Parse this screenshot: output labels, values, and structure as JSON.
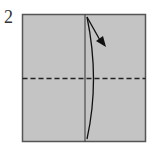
{
  "diagram": {
    "step_number": "2",
    "paper_color": "#c4c4c4",
    "border_color": "#555555",
    "line_color": "#111111",
    "elements": [
      {
        "type": "square",
        "label": "paper"
      },
      {
        "type": "crease",
        "label": "vertical center crease"
      },
      {
        "type": "valley-fold-line",
        "label": "horizontal dashed fold line"
      },
      {
        "type": "arrow",
        "label": "fold direction arrow (curved, pointing to upper right)"
      }
    ]
  }
}
